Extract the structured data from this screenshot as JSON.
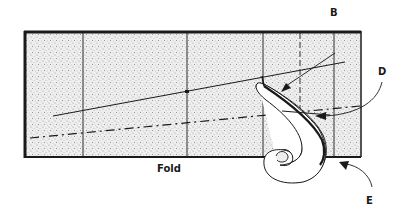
{
  "diagram": {
    "background": "#ffffff",
    "sheet_fill": "#e8e8e8",
    "ink": "#1a1a1a",
    "labels": {
      "B": "B",
      "D": "D",
      "E": "E",
      "fold": "Fold"
    },
    "elements": {
      "sheet": "stippled rectangular fabric/paper piece with thick dark border",
      "vertical_lines": [
        "solid",
        "solid",
        "solid",
        "dashed",
        "solid"
      ],
      "straight_line": "solid diagonal reference line rising to the right",
      "dashed_line": "dash-dot line rising to the right",
      "curve": "French curve tool placed near right edge, scroll end below fold",
      "arrows": [
        "B arrow pointing to curve tip",
        "D curved arrow pointing to dashed line",
        "E curved arrow pointing to bottom right corner"
      ]
    }
  }
}
